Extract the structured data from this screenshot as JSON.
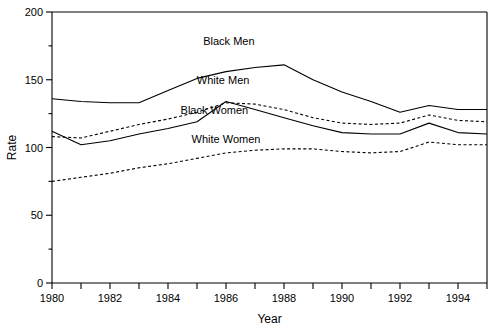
{
  "chart_data": {
    "type": "line",
    "title": "",
    "xlabel": "Year",
    "ylabel": "Rate",
    "xlim": [
      1980,
      1995
    ],
    "ylim": [
      0,
      200
    ],
    "ytick_values": [
      0,
      50,
      100,
      150,
      200
    ],
    "ytick_labels": [
      "0",
      "50",
      "100",
      "150",
      "200"
    ],
    "yminor_step": 25,
    "xtick_values": [
      1980,
      1981,
      1982,
      1983,
      1984,
      1985,
      1986,
      1987,
      1988,
      1989,
      1990,
      1991,
      1992,
      1993,
      1994,
      1995
    ],
    "xtick_labels": [
      "1980",
      "",
      "1982",
      "",
      "1984",
      "",
      "1986",
      "",
      "1988",
      "",
      "1990",
      "",
      "1992",
      "",
      "1994",
      ""
    ],
    "grid": false,
    "legend_position": "inline-annotations",
    "x": [
      1980,
      1981,
      1982,
      1983,
      1984,
      1985,
      1986,
      1987,
      1988,
      1989,
      1990,
      1991,
      1992,
      1993,
      1994,
      1995
    ],
    "series": [
      {
        "name": "Black Men",
        "style": "solid",
        "color": "#000000",
        "values": [
          136,
          134,
          133,
          133,
          142,
          151,
          156,
          159,
          161,
          150,
          141,
          134,
          126,
          131,
          128,
          128
        ]
      },
      {
        "name": "White Men",
        "style": "dashed",
        "color": "#000000",
        "values": [
          108,
          107,
          112,
          117,
          121,
          126,
          133,
          132,
          128,
          122,
          118,
          117,
          118,
          124,
          120,
          119
        ]
      },
      {
        "name": "Black Women",
        "style": "solid",
        "color": "#000000",
        "values": [
          112,
          102,
          105,
          110,
          114,
          119,
          134,
          128,
          122,
          116,
          111,
          110,
          110,
          118,
          111,
          110
        ]
      },
      {
        "name": "White Women",
        "style": "dashed",
        "color": "#000000",
        "values": [
          75,
          78,
          81,
          85,
          88,
          92,
          96,
          98,
          99,
          99,
          97,
          96,
          97,
          104,
          102,
          102
        ]
      }
    ],
    "annotations": [
      {
        "text": "Black Men",
        "x": 1986.1,
        "y": 176
      },
      {
        "text": "White Men",
        "x": 1985.9,
        "y": 147
      },
      {
        "text": "Black Women",
        "x": 1985.6,
        "y": 125
      },
      {
        "text": "White Women",
        "x": 1986.0,
        "y": 103
      }
    ]
  },
  "axis": {
    "ylabel": "Rate",
    "xlabel": "Year"
  }
}
